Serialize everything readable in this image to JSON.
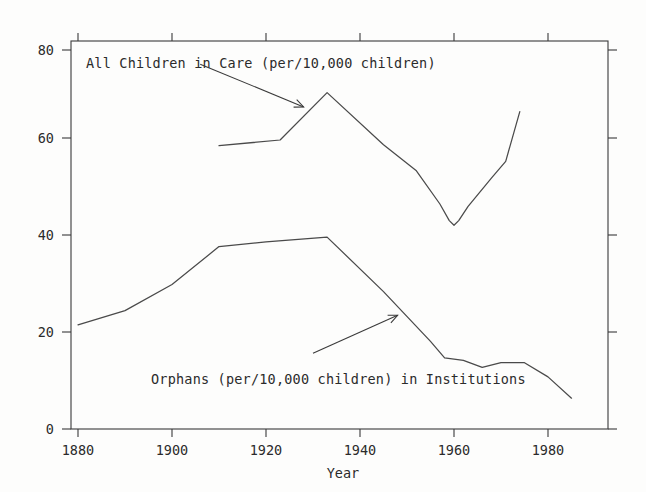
{
  "chart_data": {
    "type": "line",
    "title": "",
    "xlabel": "Year",
    "ylabel": "",
    "xlim": [
      1876,
      1989
    ],
    "ylim": [
      0,
      84
    ],
    "xticks": [
      1880,
      1900,
      1920,
      1940,
      1960,
      1980
    ],
    "yticks": [
      0,
      20,
      40,
      60,
      80
    ],
    "grid": false,
    "legend_position": "inline-annotations",
    "series": [
      {
        "name": "All Children in Care (per/10,000 children)",
        "x": [
          1910,
          1923,
          1933,
          1945,
          1952,
          1957,
          1959,
          1960,
          1961,
          1963,
          1968,
          1971,
          1974
        ],
        "values": [
          59.8,
          61.0,
          71.0,
          60.0,
          54.5,
          47.5,
          44.0,
          43.0,
          44.0,
          47.0,
          53.0,
          56.5,
          67.0
        ]
      },
      {
        "name": "Orphans (per/10,000 children) in Institutions",
        "x": [
          1880,
          1890,
          1900,
          1910,
          1920,
          1933,
          1945,
          1955,
          1958,
          1962,
          1966,
          1970,
          1975,
          1980,
          1985
        ],
        "values": [
          22.0,
          25.0,
          30.5,
          38.5,
          39.5,
          40.5,
          29.0,
          18.5,
          15.0,
          14.5,
          13.0,
          14.0,
          14.0,
          11.0,
          6.5
        ]
      }
    ],
    "annotations": [
      {
        "text": "All Children in Care (per/10,000 children)",
        "label_x": 1880,
        "label_y": 79,
        "arrow_from_year": 1906,
        "arrow_from_value": 77,
        "arrow_to_year": 1928,
        "arrow_to_value": 68
      },
      {
        "text": "Orphans (per/10,000 children) in Institutions",
        "label_x": 1895,
        "label_y": 9,
        "arrow_from_year": 1930,
        "arrow_from_value": 16,
        "arrow_to_year": 1948,
        "arrow_to_value": 24
      }
    ],
    "colors": {
      "line": "#4a4a4a",
      "axis": "#3a3a3a",
      "text": "#2b2b2b",
      "background": "#fdfdfc"
    }
  },
  "axis": {
    "x_title": "Year",
    "x_tick_labels": [
      "1880",
      "1900",
      "1920",
      "1940",
      "1960",
      "1980"
    ],
    "y_tick_labels": [
      "0",
      "20",
      "40",
      "60",
      "80"
    ]
  },
  "labels": {
    "series_top": "All Children in Care (per/10,000 children)",
    "series_bottom": "Orphans (per/10,000 children) in Institutions"
  }
}
